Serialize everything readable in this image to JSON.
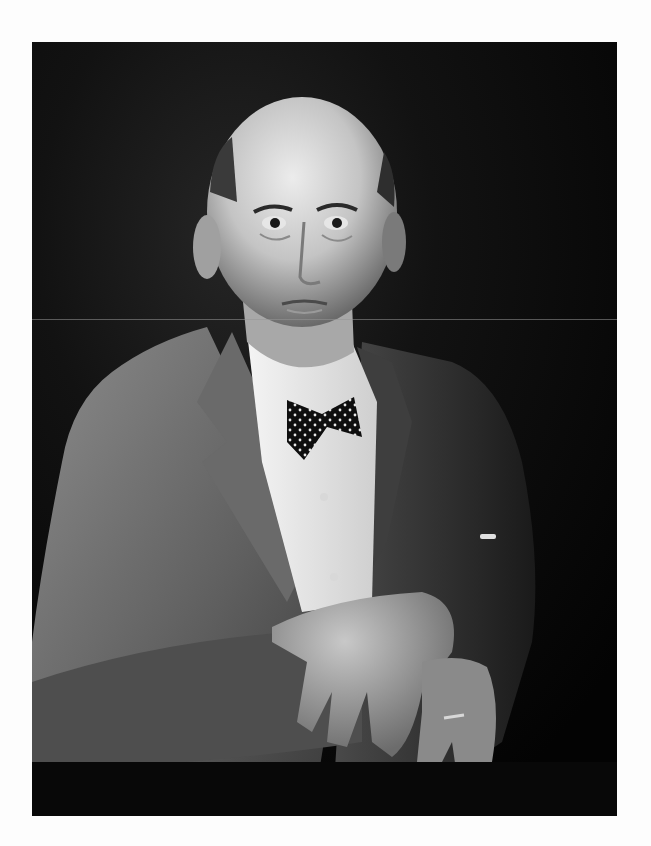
{
  "image": {
    "type": "black-and-white portrait photograph",
    "subject": "older bald man in tweed jacket, white shirt and polka-dot bow tie, hands crossed",
    "background_color": "#ffffff",
    "photo_frame": {
      "left": 32,
      "top": 42,
      "width": 585,
      "height": 774
    },
    "colors": {
      "backdrop": "#070707",
      "jacket": "#6e6e6e",
      "shirt": "#e8e8e8",
      "skin": "#b8b8b8",
      "bow_tie": "#111111"
    },
    "details": {
      "bow_tie_pattern": "white polka dots",
      "ring": "wedding band on left ring finger",
      "crease_line_y": 319
    }
  }
}
